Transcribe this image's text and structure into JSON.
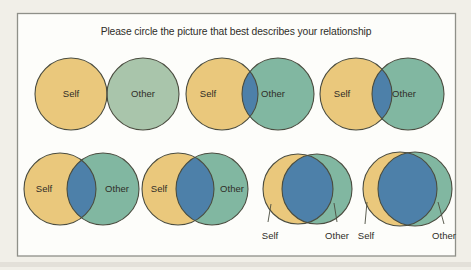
{
  "instruction": "Please circle the picture that best describes your relationship",
  "colors": {
    "page_bg": "#f1efe8",
    "panel_bg": "#fdfdfa",
    "panel_border": "#8f9089",
    "self_fill": "#eac87c",
    "other_fill": "#81b7a1",
    "other_fill_light": "#a9c5ab",
    "overlap_fill": "#4d80a9",
    "outline_color": "#4b4d40",
    "text_color": "#2f2d28"
  },
  "options": [
    {
      "index": 1,
      "self_label": "Self",
      "other_label": "Other",
      "overlap": "none (circles touching)"
    },
    {
      "index": 2,
      "self_label": "Self",
      "other_label": "Other",
      "overlap": "very small"
    },
    {
      "index": 3,
      "self_label": "Self",
      "other_label": "Other",
      "overlap": "small"
    },
    {
      "index": 4,
      "self_label": "Self",
      "other_label": "Other",
      "overlap": "moderate"
    },
    {
      "index": 5,
      "self_label": "Self",
      "other_label": "Other",
      "overlap": "large"
    },
    {
      "index": 6,
      "self_label": "Self",
      "other_label": "Other",
      "overlap": "very large"
    },
    {
      "index": 7,
      "self_label": "Self",
      "other_label": "Other",
      "overlap": "almost complete"
    }
  ]
}
